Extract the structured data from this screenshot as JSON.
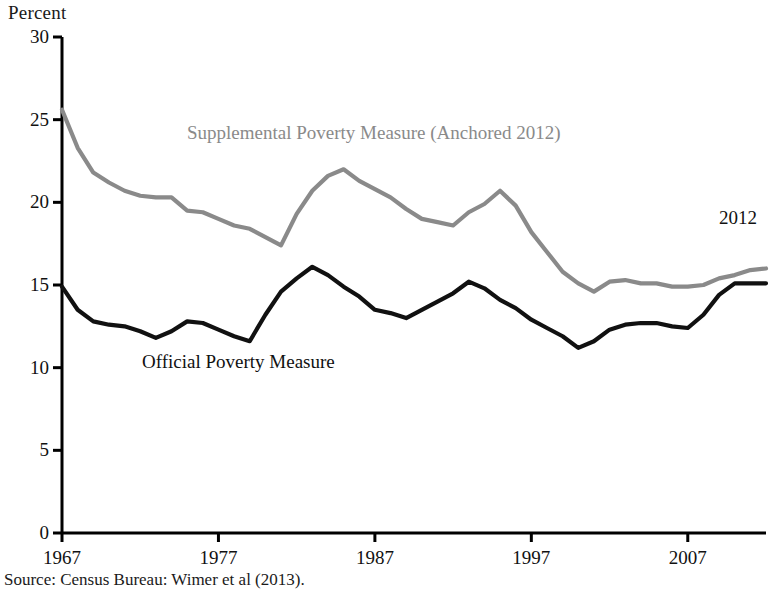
{
  "axis_unit_label": "Percent",
  "source_note": "Source: Census Bureau: Wimer et al (2013).",
  "annotations": {
    "spm_label": "Supplemental Poverty Measure (Anchored 2012)",
    "official_label": "Official Poverty Measure",
    "end_year_label": "2012"
  },
  "colors": {
    "official_line": "#111111",
    "spm_line": "#8a8a8a",
    "axis": "#000000",
    "background": "#ffffff"
  },
  "chart_data": {
    "type": "line",
    "title": "",
    "subtitle": "",
    "xlabel": "",
    "ylabel": "Percent",
    "xlim": [
      1967,
      2012
    ],
    "ylim": [
      0,
      30
    ],
    "yticks": [
      0,
      5,
      10,
      15,
      20,
      25,
      30
    ],
    "ytick_labels": [
      "0",
      "5",
      "10",
      "15",
      "20",
      "25",
      "30"
    ],
    "xticks": [
      1967,
      1977,
      1987,
      1997,
      2007
    ],
    "xtick_labels": [
      "1967",
      "1977",
      "1987",
      "1997",
      "2007"
    ],
    "grid": false,
    "legend_position": "inline-annotations",
    "x": [
      1967,
      1968,
      1969,
      1970,
      1971,
      1972,
      1973,
      1974,
      1975,
      1976,
      1977,
      1978,
      1979,
      1980,
      1981,
      1982,
      1983,
      1984,
      1985,
      1986,
      1987,
      1988,
      1989,
      1990,
      1991,
      1992,
      1993,
      1994,
      1995,
      1996,
      1997,
      1998,
      1999,
      2000,
      2001,
      2002,
      2003,
      2004,
      2005,
      2006,
      2007,
      2008,
      2009,
      2010,
      2011,
      2012
    ],
    "series": [
      {
        "name": "Supplemental Poverty Measure (Anchored 2012)",
        "color": "#8a8a8a",
        "values": [
          25.6,
          23.3,
          21.8,
          21.2,
          20.7,
          20.4,
          20.3,
          20.3,
          19.5,
          19.4,
          19.0,
          18.6,
          18.4,
          17.9,
          17.4,
          19.3,
          20.7,
          21.6,
          22.0,
          21.3,
          20.8,
          20.3,
          19.6,
          19.0,
          18.8,
          18.6,
          19.4,
          19.9,
          20.7,
          19.8,
          18.2,
          17.0,
          15.8,
          15.1,
          14.6,
          15.2,
          15.3,
          15.1,
          15.1,
          14.9,
          14.9,
          15.0,
          15.4,
          15.6,
          15.9,
          16.0
        ],
        "last_value_label": "2012"
      },
      {
        "name": "Official Poverty Measure",
        "color": "#111111",
        "values": [
          14.9,
          13.5,
          12.8,
          12.6,
          12.5,
          12.2,
          11.8,
          12.2,
          12.8,
          12.7,
          12.3,
          11.9,
          11.6,
          13.2,
          14.6,
          15.4,
          16.1,
          15.6,
          14.9,
          14.3,
          13.5,
          13.3,
          13.0,
          13.5,
          14.0,
          14.5,
          15.2,
          14.8,
          14.1,
          13.6,
          12.9,
          12.4,
          11.9,
          11.2,
          11.6,
          12.3,
          12.6,
          12.7,
          12.7,
          12.5,
          12.4,
          13.2,
          14.4,
          15.1,
          15.1,
          15.1
        ],
        "last_value_label": ""
      }
    ]
  }
}
